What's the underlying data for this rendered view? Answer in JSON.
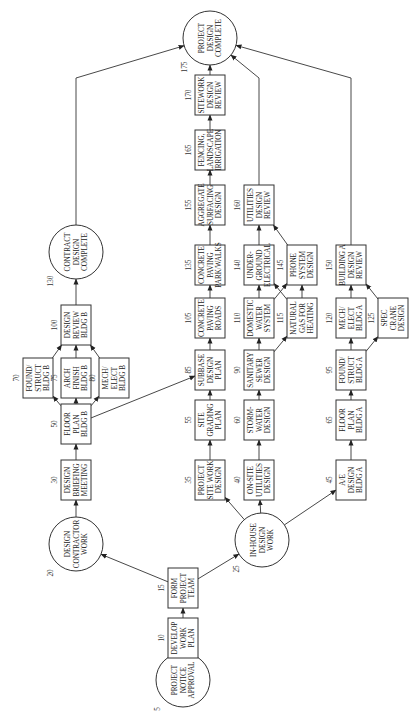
{
  "diagram": {
    "type": "activity-on-node network (rotated 90°)",
    "nodes": [
      {
        "id": "5",
        "shape": "circle",
        "x": 36,
        "y": 183,
        "lines": [
          "PROJECT",
          "NOTICE",
          "APPROVAL"
        ]
      },
      {
        "id": "10",
        "shape": "box",
        "x": 78,
        "y": 183,
        "lines": [
          "DEVELOP",
          "WORK",
          "PLAN"
        ]
      },
      {
        "id": "15",
        "shape": "box",
        "x": 128,
        "y": 183,
        "lines": [
          "FORM",
          "PROJECT",
          "TEAM"
        ]
      },
      {
        "id": "20",
        "shape": "circle",
        "x": 172,
        "y": 76,
        "lines": [
          "DESIGN",
          "CONTRACTOR",
          "WORK"
        ]
      },
      {
        "id": "25",
        "shape": "circle",
        "x": 176,
        "y": 262,
        "lines": [
          "IN-HOUSE",
          "DESIGN",
          "WORK"
        ]
      },
      {
        "id": "30",
        "shape": "box",
        "x": 236,
        "y": 76,
        "lines": [
          "DESIGN",
          "BRIEFING",
          "MEETING"
        ]
      },
      {
        "id": "50",
        "shape": "box",
        "x": 292,
        "y": 76,
        "lines": [
          "FLOOR",
          "PLAN",
          "BLDG B"
        ]
      },
      {
        "id": "70",
        "shape": "box",
        "x": 338,
        "y": 38,
        "lines": [
          "FOUND/",
          "STRUCT",
          "BLDG B"
        ]
      },
      {
        "id": "75",
        "shape": "box",
        "x": 338,
        "y": 76,
        "lines": [
          "ARCH",
          "FINISH",
          "BLDG B"
        ]
      },
      {
        "id": "80",
        "shape": "box",
        "x": 338,
        "y": 114,
        "lines": [
          "MECH/",
          "ELECT",
          "BLDG B"
        ]
      },
      {
        "id": "100",
        "shape": "box",
        "x": 391,
        "y": 76,
        "lines": [
          "DESIGN",
          "REVIEW",
          "BLDG B"
        ]
      },
      {
        "id": "130",
        "shape": "circle",
        "x": 464,
        "y": 76,
        "lines": [
          "CONTRACT",
          "DESIGN",
          "COMPLETE"
        ]
      },
      {
        "id": "35",
        "shape": "box",
        "x": 236,
        "y": 210,
        "lines": [
          "PROJECT",
          "SITE WORK",
          "DESIGN"
        ]
      },
      {
        "id": "55",
        "shape": "box",
        "x": 296,
        "y": 210,
        "lines": [
          "SITE",
          "GRADING",
          "PLAN"
        ]
      },
      {
        "id": "85",
        "shape": "box",
        "x": 346,
        "y": 210,
        "lines": [
          "SUBBASE",
          "DESIGN",
          "PLAN"
        ]
      },
      {
        "id": "105",
        "shape": "box",
        "x": 398,
        "y": 210,
        "lines": [
          "CONCRETE",
          "PAVING",
          "ROADS"
        ]
      },
      {
        "id": "135",
        "shape": "box",
        "x": 451,
        "y": 210,
        "lines": [
          "CONCRETE",
          "PAVING",
          "PARK/WALKS"
        ]
      },
      {
        "id": "155",
        "shape": "box",
        "x": 511,
        "y": 210,
        "lines": [
          "AGGREGATE",
          "SURFACING",
          "DESIGN"
        ]
      },
      {
        "id": "165",
        "shape": "box",
        "x": 566,
        "y": 210,
        "lines": [
          "FENCING,",
          "LANDSCAPE",
          "IRRIGATION"
        ]
      },
      {
        "id": "170",
        "shape": "box",
        "x": 621,
        "y": 210,
        "lines": [
          "SITEWORK",
          "DESIGN",
          "REVIEW"
        ]
      },
      {
        "id": "175",
        "shape": "circle",
        "x": 678,
        "y": 210,
        "lines": [
          "PROJECT",
          "DESIGN",
          "COMPLETE"
        ]
      },
      {
        "id": "40",
        "shape": "box",
        "x": 236,
        "y": 259,
        "lines": [
          "ON-SITE",
          "UTILITIES",
          "DESIGN"
        ]
      },
      {
        "id": "60",
        "shape": "box",
        "x": 296,
        "y": 259,
        "lines": [
          "STORM-",
          "WATER",
          "DESIGN"
        ]
      },
      {
        "id": "90",
        "shape": "box",
        "x": 346,
        "y": 259,
        "lines": [
          "SANITARY",
          "SEWER",
          "DESIGN"
        ]
      },
      {
        "id": "110",
        "shape": "box",
        "x": 398,
        "y": 259,
        "lines": [
          "DOMESTIC",
          "WATER",
          "SYSTEM"
        ]
      },
      {
        "id": "115",
        "shape": "box",
        "x": 398,
        "y": 302,
        "lines": [
          "NATURAL",
          "GAS FOR",
          "HEATING"
        ]
      },
      {
        "id": "140",
        "shape": "box",
        "x": 451,
        "y": 259,
        "lines": [
          "UNDER-",
          "GROUND",
          "ELECTRICAL"
        ]
      },
      {
        "id": "145",
        "shape": "box",
        "x": 451,
        "y": 302,
        "lines": [
          "PHONE",
          "SYSTEM",
          "DESIGN"
        ]
      },
      {
        "id": "160",
        "shape": "box",
        "x": 511,
        "y": 259,
        "lines": [
          "UTILITIES",
          "DESIGN",
          "REVIEW"
        ]
      },
      {
        "id": "45",
        "shape": "box",
        "x": 236,
        "y": 351,
        "lines": [
          "A/E",
          "DESIGN",
          "BLDG A"
        ]
      },
      {
        "id": "65",
        "shape": "box",
        "x": 296,
        "y": 351,
        "lines": [
          "FLOOR",
          "PLAN",
          "BLDG A"
        ]
      },
      {
        "id": "95",
        "shape": "box",
        "x": 346,
        "y": 351,
        "lines": [
          "FOUND/",
          "STRUCT",
          "BLDG A"
        ]
      },
      {
        "id": "120",
        "shape": "box",
        "x": 398,
        "y": 351,
        "lines": [
          "MECH/",
          "ELECT",
          "BLDG A"
        ]
      },
      {
        "id": "125",
        "shape": "box",
        "x": 398,
        "y": 393,
        "lines": [
          "SPEC",
          "CRANE",
          "DESIGN"
        ]
      },
      {
        "id": "150",
        "shape": "box",
        "x": 451,
        "y": 351,
        "lines": [
          "BUILDING A",
          "DESIGN",
          "REVIEW"
        ]
      }
    ],
    "edges": [
      [
        "5",
        "10"
      ],
      [
        "10",
        "15"
      ],
      [
        "15",
        "20"
      ],
      [
        "15",
        "25"
      ],
      [
        "20",
        "30"
      ],
      [
        "30",
        "50"
      ],
      [
        "50",
        "70"
      ],
      [
        "50",
        "75"
      ],
      [
        "50",
        "80"
      ],
      [
        "50",
        "85"
      ],
      [
        "70",
        "100"
      ],
      [
        "75",
        "100"
      ],
      [
        "80",
        "100"
      ],
      [
        "100",
        "130"
      ],
      [
        "130",
        "175"
      ],
      [
        "25",
        "35"
      ],
      [
        "25",
        "40"
      ],
      [
        "25",
        "45"
      ],
      [
        "35",
        "55"
      ],
      [
        "55",
        "85"
      ],
      [
        "85",
        "105"
      ],
      [
        "105",
        "135"
      ],
      [
        "135",
        "155"
      ],
      [
        "155",
        "165"
      ],
      [
        "165",
        "170"
      ],
      [
        "170",
        "175"
      ],
      [
        "40",
        "60"
      ],
      [
        "60",
        "90"
      ],
      [
        "90",
        "110"
      ],
      [
        "90",
        "115"
      ],
      [
        "110",
        "140"
      ],
      [
        "110",
        "145"
      ],
      [
        "115",
        "140"
      ],
      [
        "115",
        "145"
      ],
      [
        "140",
        "160"
      ],
      [
        "145",
        "160"
      ],
      [
        "160",
        "175"
      ],
      [
        "45",
        "65"
      ],
      [
        "65",
        "95"
      ],
      [
        "95",
        "120"
      ],
      [
        "95",
        "125"
      ],
      [
        "120",
        "150"
      ],
      [
        "125",
        "150"
      ],
      [
        "150",
        "175"
      ]
    ]
  }
}
